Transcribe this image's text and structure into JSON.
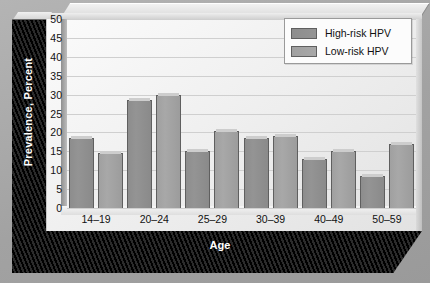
{
  "chart_data": {
    "type": "bar",
    "title": "",
    "xlabel": "Age",
    "ylabel": "Prevalence, Percent",
    "categories": [
      "14–19",
      "20–24",
      "25–29",
      "30–39",
      "40–49",
      "50–59"
    ],
    "series": [
      {
        "name": "High-risk HPV",
        "color": "#909090",
        "values": [
          18.5,
          28.5,
          15.0,
          18.5,
          13.0,
          8.5
        ]
      },
      {
        "name": "Low-risk HPV",
        "color": "#a4a4a4",
        "values": [
          14.5,
          30.0,
          20.5,
          19.0,
          15.0,
          17.0
        ]
      }
    ],
    "ylim": [
      0,
      50
    ],
    "ytick_step": 5,
    "yticks": [
      50,
      45,
      40,
      35,
      30,
      25,
      20,
      15,
      10,
      5,
      0
    ],
    "ytick_labels": [
      "50",
      "45",
      "40",
      "35",
      "30",
      "25",
      "20",
      "15",
      "10",
      "5",
      "0"
    ],
    "grid": true,
    "grid_axis": "y",
    "legend_position": "top-right"
  },
  "legend": {
    "entries": [
      {
        "label": "High-risk HPV"
      },
      {
        "label": "Low-risk HPV"
      }
    ]
  },
  "axes": {
    "x_title": "Age",
    "y_title": "Prevalence, Percent"
  },
  "colors": {
    "series_high_risk": "#909090",
    "series_low_risk": "#a4a4a4",
    "plot_background": "#f2f2f2",
    "frame_background": "#a9a9a9",
    "panel_dark": "#000000",
    "gridline": "#cfcfcf"
  }
}
